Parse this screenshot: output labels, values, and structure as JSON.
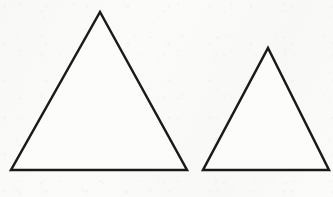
{
  "figure": {
    "kind": "geometry-figure",
    "width": 333,
    "height": 197,
    "background_color": "#fbfbfa",
    "stroke_color": "#1a1a1a",
    "fill_color": "#fcfcfb",
    "shape_count": "2"
  },
  "shapes": [
    {
      "name": "large-triangle",
      "label": "Large triangle",
      "type": "triangle",
      "classification": "isosceles",
      "stroke_color": "#1a1a1a",
      "fill_color": "#fcfcfb",
      "stroke_width": 2.5,
      "points": "100,12 187,170 11,170",
      "apex": {
        "x": 100,
        "y": 12
      },
      "bottom_left": {
        "x": 11,
        "y": 170
      },
      "bottom_right": {
        "x": 187,
        "y": 170
      },
      "base_width": 176,
      "height": 158
    },
    {
      "name": "small-triangle",
      "label": "Small triangle",
      "type": "triangle",
      "classification": "isosceles",
      "stroke_color": "#1a1a1a",
      "fill_color": "#fcfcfb",
      "stroke_width": 2.5,
      "points": "268,48 329,170 203,170",
      "apex": {
        "x": 268,
        "y": 48
      },
      "bottom_left": {
        "x": 203,
        "y": 170
      },
      "bottom_right": {
        "x": 329,
        "y": 170
      },
      "base_width": 126,
      "height": 122
    }
  ],
  "baseline": {
    "name": "shared-baseline",
    "y": 170,
    "note": "Both triangles rest on the same horizontal baseline"
  }
}
